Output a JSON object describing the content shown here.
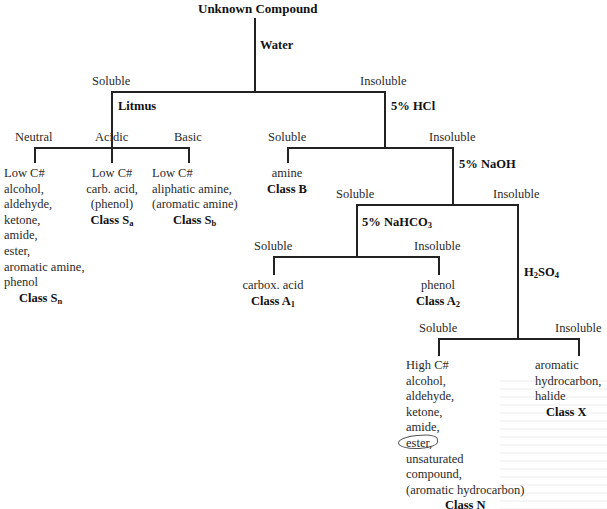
{
  "diagram": {
    "root": "Unknown Compound",
    "tests": {
      "water": "Water",
      "litmus": "Litmus",
      "hcl": "5% HCl",
      "naoh": "5% NaOH",
      "nahco3_base": "5% NaHCO",
      "nahco3_sub": "3",
      "h2so4_h": "H",
      "h2so4_sub1": "2",
      "h2so4_so": "SO",
      "h2so4_sub2": "4"
    },
    "branch_labels": {
      "water_soluble": "Soluble",
      "water_insoluble": "Insoluble",
      "litmus_neutral": "Neutral",
      "litmus_acidic": "Acidic",
      "litmus_basic": "Basic",
      "hcl_soluble": "Soluble",
      "hcl_insoluble": "Insoluble",
      "naoh_soluble": "Soluble",
      "naoh_insoluble": "Insoluble",
      "nahco3_soluble": "Soluble",
      "nahco3_insoluble": "Insoluble",
      "h2so4_soluble": "Soluble",
      "h2so4_insoluble": "Insoluble"
    },
    "classes": {
      "sn": {
        "lines": [
          "Low C#",
          "alcohol,",
          "aldehyde,",
          "ketone,",
          "amide,",
          "ester,",
          "aromatic amine,",
          "phenol"
        ],
        "class_prefix": "Class S",
        "class_sub": "n"
      },
      "sa": {
        "lines": [
          "Low C#",
          "carb. acid,",
          "(phenol)"
        ],
        "class_prefix": "Class S",
        "class_sub": "a"
      },
      "sb": {
        "lines": [
          "Low C#",
          "aliphatic amine,",
          "(aromatic amine)"
        ],
        "class_prefix": "Class S",
        "class_sub": "b"
      },
      "b": {
        "lines": [
          "amine"
        ],
        "class_prefix": "Class B",
        "class_sub": ""
      },
      "a1": {
        "lines": [
          "carbox. acid"
        ],
        "class_prefix": "Class A",
        "class_sub": "1"
      },
      "a2": {
        "lines": [
          "phenol"
        ],
        "class_prefix": "Class A",
        "class_sub": "2"
      },
      "n": {
        "lines": [
          "High C#",
          "alcohol,",
          "aldehyde,",
          "ketone,",
          "amide,",
          "ester,",
          "unsaturated",
          "compound,",
          "(aromatic hydrocarbon)"
        ],
        "class_prefix": "Class N",
        "class_sub": ""
      },
      "x": {
        "lines": [
          "aromatic",
          "hydrocarbon,",
          "halide"
        ],
        "class_prefix": "Class X",
        "class_sub": ""
      }
    },
    "annotations": {
      "circled_word": "ester,"
    }
  }
}
